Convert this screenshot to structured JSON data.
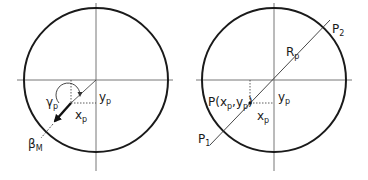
{
  "diagram": {
    "colors": {
      "circle": "#1a1a1a",
      "axis": "#777777",
      "text": "#1a1a1a",
      "arrow": "#111111"
    },
    "left_panel": {
      "labels": {
        "gamma": {
          "main": "γ",
          "sub": "p"
        },
        "y": {
          "main": "y",
          "sub": "p"
        },
        "x": {
          "main": "x",
          "sub": "p"
        },
        "beta": {
          "main": "β",
          "sub": "M"
        }
      }
    },
    "right_panel": {
      "labels": {
        "p2": {
          "main": "P",
          "sub": "2"
        },
        "r": {
          "main": "R",
          "sub": "p"
        },
        "point": {
          "pre": "P(x",
          "sub1": "p",
          "mid": ",y",
          "sub2": "p",
          "post": ")"
        },
        "y": {
          "main": "y",
          "sub": "p"
        },
        "x": {
          "main": "x",
          "sub": "p"
        },
        "p1": {
          "main": "P",
          "sub": "1"
        }
      }
    }
  }
}
